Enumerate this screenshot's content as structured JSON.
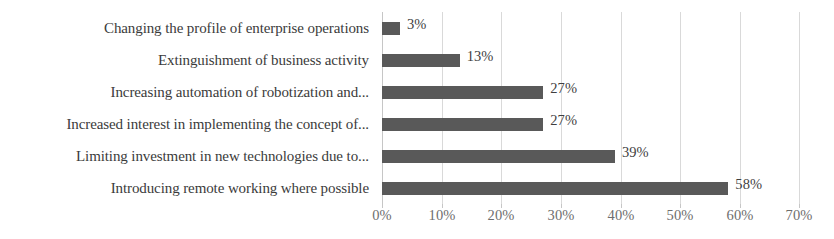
{
  "chart_data": {
    "type": "bar",
    "orientation": "horizontal",
    "title": "",
    "subtitle": "",
    "xlabel": "",
    "ylabel": "",
    "xlim": [
      0,
      70
    ],
    "x_tick_labels": [
      "0%",
      "10%",
      "20%",
      "30%",
      "40%",
      "50%",
      "60%",
      "70%"
    ],
    "x_tick_values": [
      0,
      10,
      20,
      30,
      40,
      50,
      60,
      70
    ],
    "grid": true,
    "legend": "none",
    "value_label_suffix": "%",
    "bar_color": "#595959",
    "gridline_color": "#d9d9d9",
    "label_color": "#3b3b3b",
    "tick_label_color": "#6e6e6e",
    "categories": [
      "Changing the profile of enterprise operations",
      "Extinguishment of business activity",
      "Increasing automation of robotization and...",
      "Increased interest in implementing the concept of...",
      "Limiting investment in new technologies due to...",
      "Introducing remote working where possible"
    ],
    "values": [
      3,
      13,
      27,
      27,
      39,
      58
    ],
    "value_labels": [
      "3%",
      "13%",
      "27%",
      "27%",
      "39%",
      "58%"
    ]
  }
}
